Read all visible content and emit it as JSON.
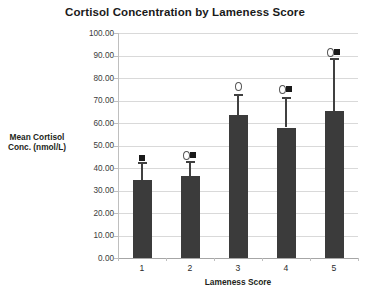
{
  "chart_data": {
    "type": "bar",
    "title": "Cortisol Concentration by Lameness Score",
    "xlabel": "Lameness Score",
    "ylabel": "Mean Cortisol Conc. (nmol/L)",
    "ylabel_lines": [
      "Mean Cortisol",
      "Conc. (nmol/L)"
    ],
    "categories": [
      "1",
      "2",
      "3",
      "4",
      "5"
    ],
    "values": [
      34.6,
      36.4,
      63.4,
      58.0,
      65.3
    ],
    "errors_upper": [
      42.5,
      43.0,
      73.0,
      71.5,
      89.0
    ],
    "series": [
      {
        "name": "Mean Cortisol Conc. (nmol/L)",
        "values": [
          34.6,
          36.4,
          63.4,
          58.0,
          65.3
        ]
      }
    ],
    "ylim": [
      0,
      100
    ],
    "ytick_values": [
      0,
      10,
      20,
      30,
      40,
      50,
      60,
      70,
      80,
      90,
      100
    ],
    "ytick_labels": [
      "0.00",
      "10.00",
      "20.00",
      "30.00",
      "40.00",
      "50.00",
      "60.00",
      "70.00",
      "80.00",
      "90.00",
      "100.00"
    ],
    "grid": true,
    "legend": "none",
    "bar_color": "#3b3b3b",
    "grid_color": "#d9d9d9",
    "annotations": [
      {
        "category": "1",
        "value": 44.5,
        "markers": [
          "square"
        ]
      },
      {
        "category": "2",
        "value": 46.0,
        "markers": [
          "circle",
          "square"
        ]
      },
      {
        "category": "3",
        "value": 76.5,
        "markers": [
          "circle"
        ]
      },
      {
        "category": "4",
        "value": 75.0,
        "markers": [
          "circle",
          "square"
        ]
      },
      {
        "category": "5",
        "value": 91.5,
        "markers": [
          "circle",
          "square"
        ]
      }
    ]
  }
}
